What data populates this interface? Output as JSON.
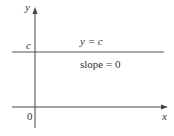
{
  "diagram": {
    "axes": {
      "x_label": "x",
      "y_label": "y",
      "origin_label": "0"
    },
    "line": {
      "y_intercept_label": "c",
      "equation": "y = c",
      "slope_text": "slope = 0"
    },
    "colors": {
      "axis": "#444444",
      "line": "#555555",
      "text": "#333333"
    }
  }
}
